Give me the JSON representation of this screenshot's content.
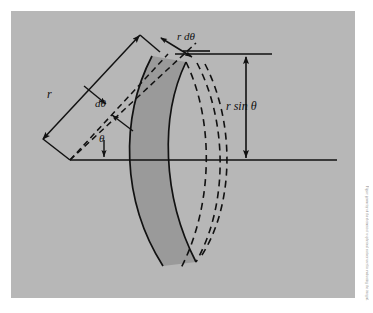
{
  "figure": {
    "panel_color": "#b7b7b7",
    "page_color": "#ffffff",
    "shade_color": "#9a9a9a",
    "ink_color": "#111111"
  },
  "labels": {
    "radius": "r",
    "d_theta": "dθ",
    "theta": "θ",
    "arc_length": "r dθ",
    "height": "r sin θ"
  },
  "side_caption": {
    "text": "Figure geometry of the element of a spherical surface used in evaluating the integral."
  },
  "geometry": {
    "origin": {
      "x": 70,
      "y": 160
    },
    "axis_horizontal": {
      "x1": 70,
      "y1": 160,
      "x2": 337,
      "y2": 160
    },
    "axis_top": {
      "x1": 175,
      "y1": 54,
      "x2": 272,
      "y2": 54
    },
    "theta_degrees": 47,
    "d_theta_degrees": 8,
    "radius_px": 140,
    "ray_inner": {
      "x1": 70,
      "y1": 160,
      "x2": 165,
      "y2": 57
    },
    "ray_outer": {
      "x1": 70,
      "y1": 160,
      "x2": 190,
      "y2": 45
    },
    "dimension_r": {
      "from": {
        "x": 43,
        "y": 138
      },
      "to": {
        "x": 139,
        "y": 35
      },
      "arrows": "both"
    },
    "dimension_rsintheta": {
      "from": {
        "x": 246,
        "y": 57
      },
      "to": {
        "x": 246,
        "y": 158
      },
      "arrows": "both"
    },
    "dimension_rdtheta": {
      "from": {
        "x": 160,
        "y": 38
      },
      "to": {
        "x": 191,
        "y": 56
      },
      "arrows": "both"
    },
    "shaded_band": {
      "description": "curved lens-shaped band between two solid arcs",
      "top": {
        "x": 152,
        "y": 56
      },
      "bottom": {
        "x": 163,
        "y": 266
      }
    },
    "dashed_arcs": 3
  },
  "annotations": {
    "arrow_theta": {
      "x": 108,
      "y": 152,
      "direction": "down"
    },
    "arrow_dtheta_upper": {
      "x": 96,
      "y": 96,
      "direction": "down-right"
    },
    "arrow_dtheta_lower": {
      "x": 118,
      "y": 122,
      "direction": "up-left"
    }
  }
}
